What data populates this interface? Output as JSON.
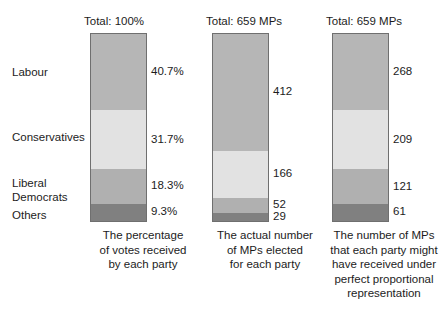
{
  "chart_data": {
    "type": "bar",
    "subtype": "stacked-bar-100-percent-and-counts",
    "title": "",
    "categories": [
      "Labour",
      "Conservatives",
      "Liberal Democrats",
      "Others"
    ],
    "xlabel": "",
    "ylabel": "",
    "grid": false,
    "legend_position": "left-axis-labels",
    "series": [
      {
        "name": "The percentage of votes received by each party",
        "total_label": "Total: 100%",
        "unit": "%",
        "values": [
          40.7,
          31.7,
          18.3,
          9.3
        ],
        "value_labels": [
          "40.7%",
          "31.7%",
          "18.3%",
          "9.3%"
        ]
      },
      {
        "name": "The actual number of MPs elected for each party",
        "total_label": "Total: 659 MPs",
        "unit": "MPs",
        "values": [
          412,
          166,
          52,
          29
        ],
        "value_labels": [
          "412",
          "166",
          "52",
          "29"
        ]
      },
      {
        "name": "The number of MPs that each party might have received under perfect proportional representation",
        "total_label": "Total: 659 MPs",
        "unit": "MPs",
        "values": [
          268,
          209,
          121,
          61
        ],
        "value_labels": [
          "268",
          "209",
          "121",
          "61"
        ]
      }
    ],
    "colors": {
      "labour": "#b6b6b6",
      "conservatives": "#e2e2e2",
      "liberal_democrats": "#b0b0b0",
      "others": "#808080",
      "bar_border": "#6f6f6f",
      "text": "#1c1c1c",
      "background": "#ffffff"
    }
  },
  "party_labels": {
    "labour": "Labour",
    "conservatives": "Conservatives",
    "liberal_democrats": "Liberal\nDemocrats",
    "others": "Others"
  },
  "columns": [
    {
      "total": "Total: 100%",
      "caption": "The percentage\nof votes received\nby each party",
      "values": [
        "40.7%",
        "31.7%",
        "18.3%",
        "9.3%"
      ]
    },
    {
      "total": "Total: 659 MPs",
      "caption": "The actual number\nof MPs elected\nfor each party",
      "values": [
        "412",
        "166",
        "52",
        "29"
      ]
    },
    {
      "total": "Total: 659 MPs",
      "caption": "The number of MPs\nthat each party might\nhave received under\nperfect proportional\nrepresentation",
      "values": [
        "268",
        "209",
        "121",
        "61"
      ]
    }
  ]
}
